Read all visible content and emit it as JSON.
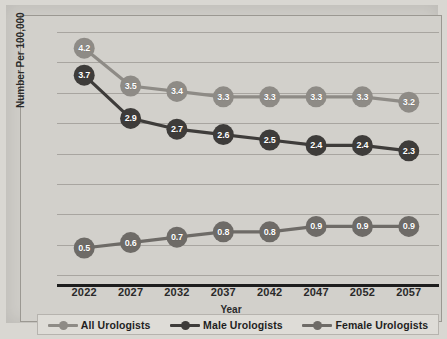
{
  "chart_data": {
    "type": "line",
    "title": "",
    "xlabel": "Year",
    "ylabel": "Number Per 100,000",
    "categories": [
      "2022",
      "2027",
      "2032",
      "2037",
      "2042",
      "2047",
      "2052",
      "2057"
    ],
    "ylim": [
      0,
      4.5
    ],
    "grid": "horizontal",
    "legend_position": "bottom",
    "series": [
      {
        "name": "All Urologists",
        "color": "#8e8b86",
        "values": [
          4.2,
          3.5,
          3.4,
          3.3,
          3.3,
          3.3,
          3.3,
          3.2
        ],
        "labels": [
          "4.2",
          "3.5",
          "3.4",
          "3.3",
          "3.3",
          "3.3",
          "3.3",
          "3.2"
        ]
      },
      {
        "name": "Male Urologists",
        "color": "#3e3c3a",
        "values": [
          3.7,
          2.9,
          2.7,
          2.6,
          2.5,
          2.4,
          2.4,
          2.3
        ],
        "labels": [
          "3.7",
          "2.9",
          "2.7",
          "2.6",
          "2.5",
          "2.4",
          "2.4",
          "2.3"
        ]
      },
      {
        "name": "Female Urologists",
        "color": "#6e6b67",
        "values": [
          0.5,
          0.6,
          0.7,
          0.8,
          0.8,
          0.9,
          0.9,
          0.9
        ],
        "labels": [
          "0.5",
          "0.6",
          "0.7",
          "0.8",
          "0.8",
          "0.9",
          "0.9",
          "0.9"
        ]
      }
    ]
  },
  "axis": {
    "x_ticks": [
      "2022",
      "2027",
      "2032",
      "2037",
      "2042",
      "2047",
      "2052",
      "2057"
    ],
    "x_title": "Year",
    "y_title": "Number Per 100,000"
  },
  "legend": {
    "items": [
      {
        "label": "All Urologists",
        "color": "#8e8b86"
      },
      {
        "label": "Male Urologists",
        "color": "#3e3c3a"
      },
      {
        "label": "Female Urologists",
        "color": "#6e6b67"
      }
    ]
  },
  "colors": {
    "background": "#cfcdc8",
    "plot_background": "#d2d0cb",
    "gridline": "#a8a5a0",
    "axis_line": "#1d1d1d",
    "text": "#2a2a2a",
    "legend_background": "#dedcd7"
  }
}
